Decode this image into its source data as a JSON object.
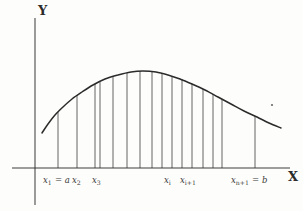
{
  "figure": {
    "kind": "riemann-sum-diagram",
    "background_color": "#fdfdfb",
    "ink_color": "#2b2b2b",
    "axes": {
      "y_axis_label": "Y",
      "x_axis_label": "X",
      "y_axis_x": 35,
      "y_axis_top": 18,
      "y_axis_bottom": 205,
      "x_axis_y": 168,
      "x_axis_left": 12,
      "x_axis_right": 290
    },
    "tick_labels": [
      {
        "id": "x1",
        "text": "x",
        "sub": "1",
        "suffix": " = a",
        "x": 43,
        "y": 176
      },
      {
        "id": "x2",
        "text": "x",
        "sub": "2",
        "suffix": "",
        "x": 72,
        "y": 176
      },
      {
        "id": "x3",
        "text": "x",
        "sub": "3",
        "suffix": "",
        "x": 92,
        "y": 176
      },
      {
        "id": "xi",
        "text": "x",
        "sub": "i",
        "suffix": "",
        "x": 164,
        "y": 176
      },
      {
        "id": "xi1",
        "text": "x",
        "sub": "i+1",
        "suffix": "",
        "x": 180,
        "y": 176
      },
      {
        "id": "xn1",
        "text": "x",
        "sub": "n+1",
        "suffix": " = b",
        "x": 231,
        "y": 176
      }
    ]
  },
  "chart_data": {
    "type": "line",
    "title": "",
    "subtitle": "",
    "xlabel": "X",
    "ylabel": "Y",
    "grid": false,
    "legend": false,
    "xlim": [
      12,
      290
    ],
    "ylim": [
      168,
      18
    ],
    "curve_points": [
      [
        42,
        133
      ],
      [
        48,
        124
      ],
      [
        55,
        115
      ],
      [
        63,
        107
      ],
      [
        72,
        99
      ],
      [
        82,
        92
      ],
      [
        93,
        85
      ],
      [
        105,
        79
      ],
      [
        118,
        75
      ],
      [
        131,
        72
      ],
      [
        143,
        71
      ],
      [
        156,
        72
      ],
      [
        168,
        75
      ],
      [
        180,
        79
      ],
      [
        192,
        84
      ],
      [
        205,
        90
      ],
      [
        218,
        97
      ],
      [
        231,
        104
      ],
      [
        244,
        111
      ],
      [
        257,
        117
      ],
      [
        269,
        123
      ],
      [
        281,
        128
      ]
    ],
    "ordinates": [
      {
        "x": 58,
        "y_top": 112,
        "y_bottom": 168
      },
      {
        "x": 77,
        "y_top": 95,
        "y_bottom": 168
      },
      {
        "x": 95,
        "y_top": 84,
        "y_bottom": 168
      },
      {
        "x": 100,
        "y_top": 82,
        "y_bottom": 168
      },
      {
        "x": 113,
        "y_top": 76,
        "y_bottom": 168
      },
      {
        "x": 127,
        "y_top": 73,
        "y_bottom": 168
      },
      {
        "x": 140,
        "y_top": 71,
        "y_bottom": 168
      },
      {
        "x": 152,
        "y_top": 72,
        "y_bottom": 168
      },
      {
        "x": 162,
        "y_top": 73,
        "y_bottom": 168
      },
      {
        "x": 172,
        "y_top": 76,
        "y_bottom": 168
      },
      {
        "x": 182,
        "y_top": 79,
        "y_bottom": 168
      },
      {
        "x": 192,
        "y_top": 84,
        "y_bottom": 168
      },
      {
        "x": 203,
        "y_top": 89,
        "y_bottom": 168
      },
      {
        "x": 213,
        "y_top": 94,
        "y_bottom": 168
      },
      {
        "x": 222,
        "y_top": 99,
        "y_bottom": 168
      },
      {
        "x": 255,
        "y_top": 116,
        "y_bottom": 168
      }
    ],
    "ink_marks": [
      {
        "id": "stray-dot",
        "x": 272,
        "y": 105,
        "r": 1.1
      }
    ]
  }
}
